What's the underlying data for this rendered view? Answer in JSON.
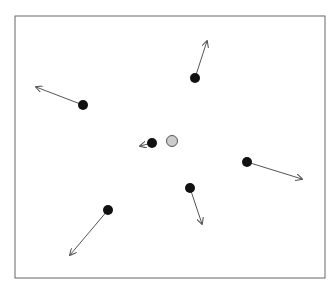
{
  "diagram": {
    "frame": {
      "x": 15,
      "y": 16,
      "width": 310,
      "height": 262,
      "stroke": "#666666"
    },
    "colors": {
      "particle": "#111111",
      "center": "#cccccc",
      "center_stroke": "#555555",
      "arrow": "#555555"
    },
    "center_particle": {
      "x": 172,
      "y": 141,
      "r": 5.5
    },
    "particles": [
      {
        "x": 195,
        "y": 78,
        "r": 5,
        "vx": 207,
        "vy": 41
      },
      {
        "x": 83,
        "y": 105,
        "r": 5,
        "vx": 36,
        "vy": 87
      },
      {
        "x": 152,
        "y": 143,
        "r": 5,
        "vx": 140,
        "vy": 146
      },
      {
        "x": 247,
        "y": 162,
        "r": 5,
        "vx": 302,
        "vy": 179
      },
      {
        "x": 190,
        "y": 188,
        "r": 5,
        "vx": 202,
        "vy": 224
      },
      {
        "x": 108,
        "y": 210,
        "r": 5,
        "vx": 70,
        "vy": 255
      }
    ]
  }
}
